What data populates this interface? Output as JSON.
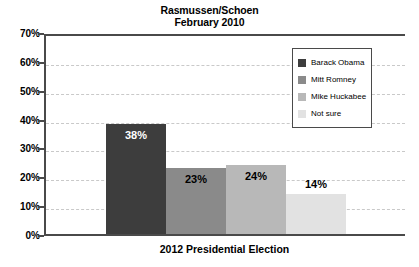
{
  "chart_data": {
    "type": "bar",
    "title": "Rasmussen/Schoen",
    "subtitle": "February 2010",
    "xlabel": "2012 Presidential Election",
    "ylabel": "",
    "categories": [
      "Barack Obama",
      "Mitt Romney",
      "Mike Huckabee",
      "Not sure"
    ],
    "values": [
      38,
      23,
      24,
      14
    ],
    "value_labels": [
      "38%",
      "23%",
      "24%",
      "14%"
    ],
    "ylim": [
      0,
      70
    ],
    "ytick_labels": [
      "0%",
      "10%",
      "20%",
      "30%",
      "40%",
      "50%",
      "60%",
      "70%"
    ],
    "ytick_values": [
      0,
      10,
      20,
      30,
      40,
      50,
      60,
      70
    ],
    "grid": true,
    "legend_position": "top-right",
    "series": [
      {
        "name": "2012 Presidential Election",
        "values": [
          38,
          23,
          24,
          14
        ]
      }
    ],
    "colors": [
      "#3d3d3d",
      "#8a8a8a",
      "#b8b8b8",
      "#e2e2e2"
    ]
  },
  "title": {
    "line1": "Rasmussen/Schoen",
    "line2": "February 2010"
  },
  "axes": {
    "x_label": "2012 Presidential Election",
    "y_ticks": [
      "70%",
      "60%",
      "50%",
      "40%",
      "30%",
      "20%",
      "10%",
      "0%"
    ]
  },
  "legend": {
    "items": [
      {
        "label": "Barack Obama",
        "color": "#3d3d3d"
      },
      {
        "label": "Mitt Romney",
        "color": "#8a8a8a"
      },
      {
        "label": "Mike Huckabee",
        "color": "#b8b8b8"
      },
      {
        "label": "Not sure",
        "color": "#e2e2e2"
      }
    ]
  },
  "bars": [
    {
      "label": "Barack Obama",
      "value": 38,
      "display": "38%",
      "color": "#3d3d3d",
      "text_on": "dark"
    },
    {
      "label": "Mitt Romney",
      "value": 23,
      "display": "23%",
      "color": "#8a8a8a",
      "text_on": "light"
    },
    {
      "label": "Mike Huckabee",
      "value": 24,
      "display": "24%",
      "color": "#b8b8b8",
      "text_on": "light"
    },
    {
      "label": "Not sure",
      "value": 14,
      "display": "14%",
      "color": "#e2e2e2",
      "text_on": "outside"
    }
  ]
}
